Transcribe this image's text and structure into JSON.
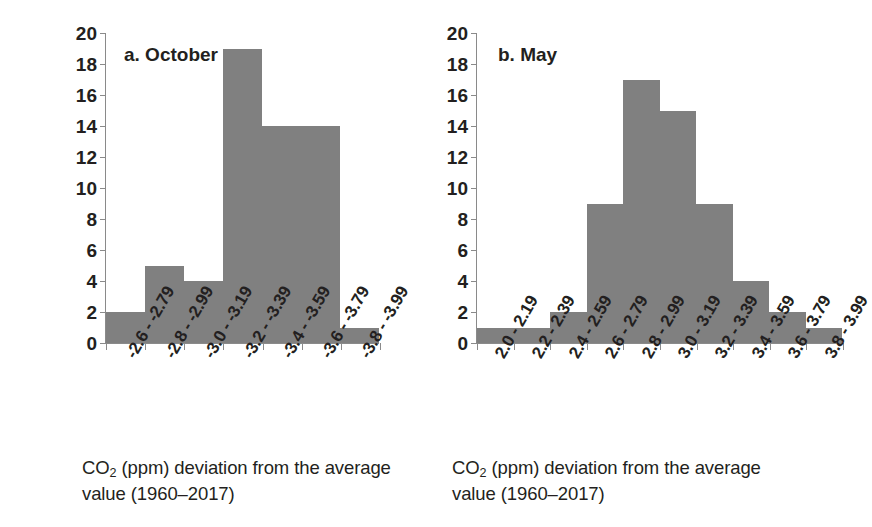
{
  "figure": {
    "y_axis_title": "# dapapoints per bin",
    "y_ticks": [
      "20",
      "18",
      "16",
      "14",
      "12",
      "10",
      "8",
      "6",
      "4",
      "2",
      "0"
    ],
    "bar_color": "#808080",
    "axis_color": "#8a8a8a"
  },
  "panel_a": {
    "caption": "a. October",
    "axis_caption_line1": "CO",
    "axis_caption_sub": "2",
    "axis_caption_line1b": " (ppm) deviation from the average",
    "axis_caption_line2": "value (1960–2017)"
  },
  "panel_b": {
    "caption": "b. May",
    "axis_caption_line1": "CO",
    "axis_caption_sub": "2",
    "axis_caption_line1b": " (ppm) deviation from the average",
    "axis_caption_line2": "value (1960–2017)"
  },
  "chart_data": [
    {
      "type": "bar",
      "title": "a. October",
      "xlabel": "CO2 (ppm) deviation from the average value (1960–2017)",
      "ylabel": "# dapapoints per bin",
      "ylim": [
        0,
        20
      ],
      "ytick_step": 2,
      "grid": false,
      "legend": false,
      "bar_color": "#808080",
      "categories": [
        "-2.6 - -2.79",
        "-2.8 - -2.99",
        "-3.0 - -3.19",
        "-3.2 - -3.39",
        "-3.4 - -3.59",
        "-3.6 - -3.79",
        "-3.8 - -3.99"
      ],
      "values": [
        2,
        5,
        4,
        19,
        14,
        14,
        1
      ]
    },
    {
      "type": "bar",
      "title": "b. May",
      "xlabel": "CO2 (ppm) deviation from the average value (1960–2017)",
      "ylabel": "# dapapoints per bin",
      "ylim": [
        0,
        20
      ],
      "ytick_step": 2,
      "grid": false,
      "legend": false,
      "bar_color": "#808080",
      "categories": [
        "2.0 - 2.19",
        "2.2 - 2.39",
        "2.4 - 2.59",
        "2.6 - 2.79",
        "2.8 - 2.99",
        "3.0 - 3.19",
        "3.2 - 3.39",
        "3.4 - 3.59",
        "3.6 - 3.79",
        "3.8 - 3.99"
      ],
      "values": [
        1,
        1,
        2,
        9,
        17,
        15,
        9,
        4,
        2,
        1
      ]
    }
  ]
}
